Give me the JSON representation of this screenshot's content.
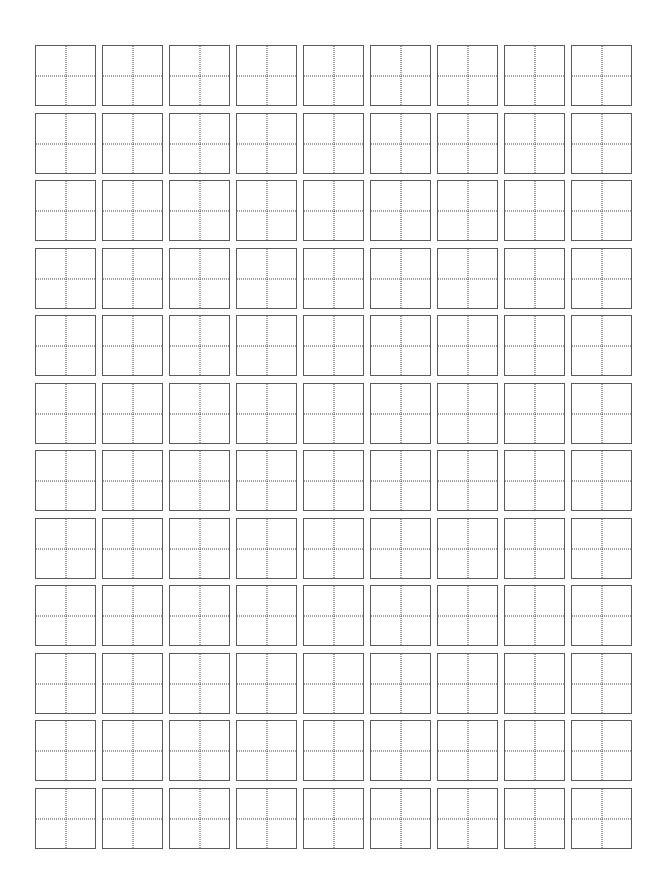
{
  "sheet": {
    "type": "tianzige-practice-grid",
    "rows": 12,
    "columns": 9,
    "origin_x": 35,
    "origin_y": 45,
    "pitch_x": 67,
    "pitch_y": 67.5,
    "cell_size": 61,
    "colors": {
      "background": "#ffffff",
      "border": "#5a5a5a",
      "guide": "#444444"
    }
  }
}
